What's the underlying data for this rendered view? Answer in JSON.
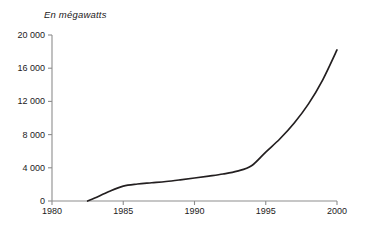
{
  "chart_data": {
    "type": "line",
    "title": "En mégawatts",
    "xlabel": "",
    "ylabel": "",
    "xlim": [
      1980,
      2000
    ],
    "ylim": [
      0,
      20000
    ],
    "grid": false,
    "legend": null,
    "x_ticks": [
      "1980",
      "1985",
      "1990",
      "1995",
      "2000"
    ],
    "x_tick_values": [
      1980,
      1985,
      1990,
      1995,
      2000
    ],
    "y_ticks": [
      "0",
      "4 000",
      "8 000",
      "12 000",
      "16 000",
      "20 000"
    ],
    "y_tick_values": [
      0,
      4000,
      8000,
      12000,
      16000,
      20000
    ],
    "series": [
      {
        "name": "Puissance installée",
        "color": "#231f20",
        "x": [
          1982.5,
          1983,
          1984,
          1985,
          1986,
          1987,
          1988,
          1989,
          1990,
          1991,
          1992,
          1993,
          1994,
          1995,
          1996,
          1997,
          1998,
          1999,
          2000
        ],
        "values": [
          0,
          350,
          1150,
          1800,
          2050,
          2200,
          2350,
          2550,
          2770,
          3000,
          3250,
          3600,
          4250,
          5900,
          7500,
          9400,
          11700,
          14600,
          18200
        ]
      }
    ]
  },
  "axes": {
    "axis_color": "#8d8d8d",
    "tick_color": "#8d8d8d",
    "line_color": "#231f20"
  }
}
